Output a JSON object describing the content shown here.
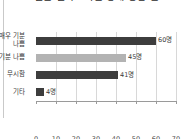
{
  "title": {
    "text": "설문 결과 - 기분 상태 응답 분포",
    "clipped": true
  },
  "chart_data": {
    "type": "bar",
    "orientation": "horizontal",
    "title": "설문 결과 - 기분 상태 응답 분포",
    "xlabel": "",
    "ylabel": "",
    "categories": [
      "매우 기분\n나쁨",
      "기분 나쁨",
      "무시함",
      "기타"
    ],
    "values": [
      60,
      45,
      41,
      4
    ],
    "value_labels": [
      "60명",
      "45명",
      "41명",
      "4명"
    ],
    "bar_colors": [
      "#3d3d3d",
      "#b3b3b3",
      "#3d3d3d",
      "#3d3d3d"
    ],
    "xlim": [
      0,
      70
    ],
    "xticks": [
      0,
      10,
      20,
      30,
      40,
      50,
      60,
      70
    ],
    "xtick_labels": [
      "0",
      "10",
      "20",
      "30",
      "40",
      "50",
      "60",
      "70"
    ],
    "grid": true,
    "grid_axis": "x",
    "legend": null,
    "unit_suffix": "명"
  },
  "colors": {
    "bar_dark": "#3d3d3d",
    "bar_light": "#b3b3b3",
    "grid": "#d8d8d8",
    "axis": "#9a9a9a",
    "text": "#3a3a3a",
    "background": "#ffffff",
    "page_rule": "#c9c9c9"
  }
}
